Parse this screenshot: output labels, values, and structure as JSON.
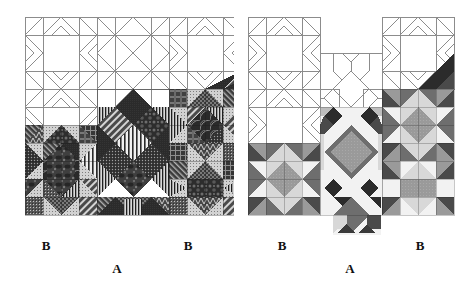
{
  "figure": {
    "panels": [
      {
        "id": "left",
        "name": "straight-set-layout",
        "labels": {
          "b_left": "B",
          "b_right": "B",
          "a": "A"
        },
        "fabric_style": "printed-dark",
        "line_color": "#8c8c8c",
        "description": "Quilt top shown partly pieced: upper blocks as outline line-art, lower-right area filled with dark printed fabrics."
      },
      {
        "id": "right",
        "name": "alternate-set-layout",
        "labels": {
          "b_left": "B",
          "b_right": "B",
          "a": "A"
        },
        "fabric_style": "flat-grayscale",
        "line_color": "#8c8c8c",
        "description": "Second quilt top: upper blocks as outline line-art with sashing star, lower area filled with flat gray value fabrics."
      }
    ],
    "colors": {
      "outline": "#8c8c8c",
      "outline_dark": "#6f6f6f",
      "background": "#ffffff",
      "label_text": "#111111",
      "value_white": "#f2f2f2",
      "value_light": "#d8d8d8",
      "value_light_mid": "#bdbdbd",
      "value_mid": "#9a9a9a",
      "value_mid_dark": "#6e6e6e",
      "value_dark": "#4a4a4a",
      "value_darkest": "#2b2b2b",
      "print_dark_a": "#3a3a3a",
      "print_dark_b": "#2e2e2e",
      "print_dark_c": "#4d4d4d",
      "print_mid": "#6a6a6a",
      "print_light": "#cfcfcf"
    }
  }
}
